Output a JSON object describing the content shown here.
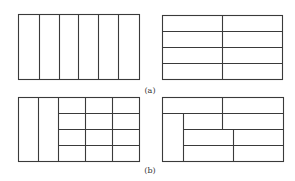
{
  "figure": {
    "stroke_color": "#3a3a3a",
    "captions": [
      {
        "label": "(a)",
        "x": 150,
        "y": 86
      },
      {
        "label": "(b)",
        "x": 150,
        "y": 166
      }
    ],
    "panels": [
      {
        "id": "a-left",
        "description": "rectangle divided into 6 vertical columns",
        "outer": [
          18,
          14,
          139,
          79
        ],
        "lines": [
          [
            39,
            14,
            39,
            79
          ],
          [
            59,
            14,
            59,
            79
          ],
          [
            78,
            14,
            78,
            79
          ],
          [
            98,
            14,
            98,
            79
          ],
          [
            118,
            14,
            118,
            79
          ]
        ]
      },
      {
        "id": "a-right",
        "description": "rectangle divided into 2 columns by 4 rows",
        "outer": [
          162,
          15,
          282,
          79
        ],
        "lines": [
          [
            222,
            15,
            222,
            79
          ],
          [
            162,
            31,
            282,
            31
          ],
          [
            162,
            47,
            282,
            47
          ],
          [
            162,
            63,
            282,
            63
          ]
        ]
      },
      {
        "id": "b-left",
        "description": "two tall columns plus a 3x4 grid",
        "outer": [
          18,
          97,
          139,
          161
        ],
        "lines": [
          [
            38,
            97,
            38,
            161
          ],
          [
            58,
            97,
            58,
            161
          ],
          [
            85,
            97,
            85,
            161
          ],
          [
            112,
            97,
            112,
            161
          ],
          [
            58,
            113,
            139,
            113
          ],
          [
            58,
            129,
            139,
            129
          ],
          [
            58,
            145,
            139,
            145
          ]
        ]
      },
      {
        "id": "b-right",
        "description": "mixed guillotine layout",
        "outer": [
          162,
          97,
          283,
          161
        ],
        "lines": [
          [
            162,
            113,
            283,
            113
          ],
          [
            222,
            97,
            222,
            129
          ],
          [
            183,
            113,
            183,
            161
          ],
          [
            183,
            129,
            283,
            129
          ],
          [
            233,
            129,
            233,
            161
          ],
          [
            183,
            145,
            283,
            145
          ]
        ]
      }
    ]
  }
}
